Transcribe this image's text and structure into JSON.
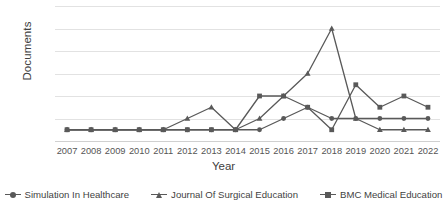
{
  "chart_data": {
    "type": "line",
    "title": "",
    "xlabel": "Year",
    "ylabel": "Documents",
    "categories": [
      "2007",
      "2008",
      "2009",
      "2010",
      "2011",
      "2012",
      "2013",
      "2014",
      "2015",
      "2016",
      "2017",
      "2018",
      "2019",
      "2020",
      "2021",
      "2022"
    ],
    "x": [
      2007,
      2008,
      2009,
      2010,
      2011,
      2012,
      2013,
      2014,
      2015,
      2016,
      2017,
      2018,
      2019,
      2020,
      2021,
      2022
    ],
    "ylim": [
      0,
      12
    ],
    "yticks": [
      0,
      2,
      4,
      6,
      8,
      10,
      12
    ],
    "ytick_labels": [
      "0",
      "2",
      "4",
      "6",
      "8",
      "10",
      "12"
    ],
    "grid": true,
    "legend_position": "bottom",
    "series_color": "#595959",
    "series": [
      {
        "name": "Simulation In Healthcare",
        "marker": "circle",
        "color": "#595959",
        "values": [
          1,
          1,
          1,
          1,
          1,
          1,
          1,
          1,
          1,
          2,
          3,
          2,
          2,
          2,
          2,
          2
        ]
      },
      {
        "name": "Journal Of Surgical Education",
        "marker": "triangle",
        "color": "#595959",
        "values": [
          1,
          1,
          1,
          1,
          1,
          2,
          3,
          1,
          2,
          4,
          6,
          10,
          2,
          1,
          1,
          1
        ]
      },
      {
        "name": "BMC Medical Education",
        "marker": "square",
        "color": "#595959",
        "values": [
          1,
          1,
          1,
          1,
          1,
          1,
          1,
          1,
          4,
          4,
          3,
          1,
          5,
          3,
          4,
          3
        ]
      }
    ]
  },
  "axes": {
    "y_title": "Documents",
    "x_title": "Year"
  },
  "legend": {
    "items": [
      {
        "label": "Simulation In Healthcare",
        "marker": "circle-marker-icon"
      },
      {
        "label": "Journal Of Surgical Education",
        "marker": "triangle-marker-icon"
      },
      {
        "label": "BMC Medical Education",
        "marker": "square-marker-icon"
      }
    ]
  }
}
